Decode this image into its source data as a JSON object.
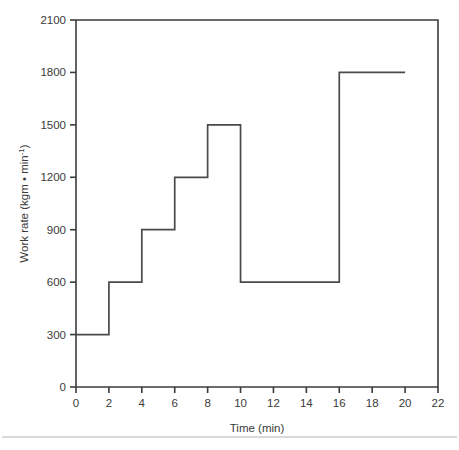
{
  "chart_data": {
    "type": "line",
    "title": "",
    "subtitle": "",
    "xlabel": "Time (min)",
    "ylabel": "Work rate (kgm • min-1)",
    "ylabel_base": "Work rate (kgm • min",
    "ylabel_sup": "-1",
    "ylabel_close": ")",
    "xlim": [
      0,
      22
    ],
    "ylim": [
      0,
      2100
    ],
    "grid": false,
    "legend": false,
    "legend_position": "none",
    "xticks": [
      0,
      2,
      4,
      6,
      8,
      10,
      12,
      14,
      16,
      18,
      20,
      22
    ],
    "xticklabels": [
      "0",
      "2",
      "4",
      "6",
      "8",
      "10",
      "12",
      "14",
      "16",
      "18",
      "20",
      "22"
    ],
    "yticks": [
      0,
      300,
      600,
      900,
      1200,
      1500,
      1800,
      2100
    ],
    "yticklabels": [
      "0",
      "300",
      "600",
      "900",
      "1200",
      "1500",
      "1800",
      "2100"
    ],
    "series": [
      {
        "name": "Work rate protocol",
        "style": "step-post",
        "color": "#4a4a4a",
        "x": [
          0,
          2,
          4,
          6,
          8,
          10,
          16,
          20
        ],
        "y": [
          300,
          600,
          900,
          1200,
          1500,
          600,
          1800,
          1800
        ],
        "steps": [
          {
            "t_start": 0,
            "t_end": 2,
            "value": 300
          },
          {
            "t_start": 2,
            "t_end": 4,
            "value": 600
          },
          {
            "t_start": 4,
            "t_end": 6,
            "value": 900
          },
          {
            "t_start": 6,
            "t_end": 8,
            "value": 1200
          },
          {
            "t_start": 8,
            "t_end": 10,
            "value": 1500
          },
          {
            "t_start": 10,
            "t_end": 16,
            "value": 600
          },
          {
            "t_start": 16,
            "t_end": 20,
            "value": 1800
          }
        ]
      }
    ]
  },
  "figure": {
    "frame_top": true,
    "frame_right": true,
    "bottom_rule": true
  }
}
